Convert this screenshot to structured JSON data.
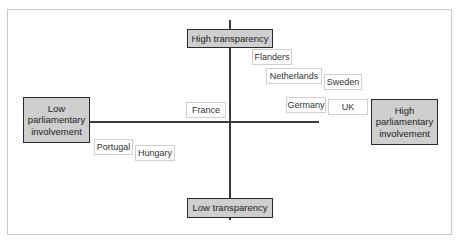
{
  "diagram": {
    "type": "quadrant",
    "axes": {
      "vertical": {
        "top": "High transparency",
        "bottom": "Low transparency"
      },
      "horizontal": {
        "left": "Low parliamentary involvement",
        "right": "High parliamentary involvement"
      }
    },
    "poles": {
      "top": "High transparency",
      "bottom": "Low transparency",
      "left": "Low parliamentary involvement",
      "right": "High parliamentary involvement"
    },
    "countries": [
      {
        "label": "Flanders",
        "quadrant": "high-transparency-high-involvement"
      },
      {
        "label": "Netherlands",
        "quadrant": "high-transparency-high-involvement"
      },
      {
        "label": "Sweden",
        "quadrant": "high-transparency-high-involvement"
      },
      {
        "label": "Germany",
        "quadrant": "high-transparency-high-involvement"
      },
      {
        "label": "UK",
        "quadrant": "high-transparency-high-involvement"
      },
      {
        "label": "France",
        "quadrant": "high-transparency-low-involvement"
      },
      {
        "label": "Portugal",
        "quadrant": "low-transparency-low-involvement"
      },
      {
        "label": "Hungary",
        "quadrant": "low-transparency-low-involvement"
      }
    ],
    "colors": {
      "pole_fill": "#cfcfcf",
      "pole_border": "#2a2a2a",
      "axis": "#3a3a3a",
      "country_border": "#cfcfcf"
    }
  }
}
